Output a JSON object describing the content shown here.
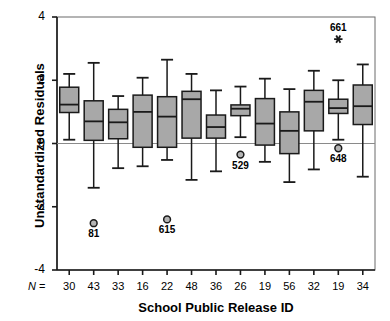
{
  "chart_data": {
    "type": "box",
    "title": "",
    "xlabel": "School Public Release ID",
    "ylabel": "Unstandardized Residuals",
    "ylim": [
      -4,
      4
    ],
    "yticks": [
      4,
      2,
      0,
      -2,
      -4
    ],
    "ytick_labels": [
      "4",
      "2",
      "0",
      "-2",
      "-4"
    ],
    "grid": false,
    "legend": null,
    "reference_line": 0,
    "n_prefix": "N =",
    "categories": [
      "30",
      "43",
      "33",
      "16",
      "22",
      "48",
      "36",
      "26",
      "19",
      "56",
      "32",
      "19",
      "34"
    ],
    "category_axis_name": "N",
    "boxes": [
      {
        "n": "30",
        "whisker_low": 0.12,
        "q1": 0.98,
        "median": 1.23,
        "q3": 1.78,
        "whisker_high": 2.2
      },
      {
        "n": "43",
        "whisker_low": -1.4,
        "q1": 0.1,
        "median": 0.7,
        "q3": 1.35,
        "whisker_high": 2.55
      },
      {
        "n": "33",
        "whisker_low": -0.78,
        "q1": 0.15,
        "median": 0.67,
        "q3": 1.08,
        "whisker_high": 1.5
      },
      {
        "n": "16",
        "whisker_low": -0.72,
        "q1": -0.12,
        "median": 1.0,
        "q3": 1.53,
        "whisker_high": 2.08
      },
      {
        "n": "22",
        "whisker_low": -0.52,
        "q1": -0.12,
        "median": 0.85,
        "q3": 1.48,
        "whisker_high": 2.65
      },
      {
        "n": "48",
        "whisker_low": -1.15,
        "q1": 0.17,
        "median": 1.4,
        "q3": 1.65,
        "whisker_high": 2.2
      },
      {
        "n": "36",
        "whisker_low": -0.88,
        "q1": 0.17,
        "median": 0.52,
        "q3": 0.9,
        "whisker_high": 1.68
      },
      {
        "n": "26",
        "whisker_low": 0.2,
        "q1": 0.88,
        "median": 1.1,
        "q3": 1.22,
        "whisker_high": 1.8
      },
      {
        "n": "19",
        "whisker_low": -0.58,
        "q1": -0.05,
        "median": 0.63,
        "q3": 1.42,
        "whisker_high": 2.05
      },
      {
        "n": "56",
        "whisker_low": -1.22,
        "q1": -0.32,
        "median": 0.4,
        "q3": 1.0,
        "whisker_high": 1.72
      },
      {
        "n": "32",
        "whisker_low": -0.82,
        "q1": 0.4,
        "median": 1.32,
        "q3": 1.68,
        "whisker_high": 2.3
      },
      {
        "n": "19",
        "whisker_low": 0.12,
        "q1": 0.95,
        "median": 1.12,
        "q3": 1.4,
        "whisker_high": 2.0
      },
      {
        "n": "34",
        "whisker_low": -1.05,
        "q1": 0.6,
        "median": 1.18,
        "q3": 1.85,
        "whisker_high": 2.5
      }
    ],
    "outliers": [
      {
        "box_index": 1,
        "value": -2.52,
        "label": "81",
        "marker": "circle",
        "label_position": "below"
      },
      {
        "box_index": 4,
        "value": -2.4,
        "label": "615",
        "marker": "circle",
        "label_position": "below"
      },
      {
        "box_index": 7,
        "value": -0.35,
        "label": "529",
        "marker": "circle",
        "label_position": "below"
      },
      {
        "box_index": 11,
        "value": -0.15,
        "label": "648",
        "marker": "circle",
        "label_position": "below"
      },
      {
        "box_index": 11,
        "value": 3.3,
        "label": "661",
        "marker": "asterisk",
        "label_position": "above"
      }
    ],
    "colors": {
      "box_fill": "#a8a8a8",
      "box_edge": "#1a1a1a",
      "whisker": "#1a1a1a",
      "median": "#1a1a1a",
      "axis": "#1a1a1a",
      "reference_line": "#8a8a8a",
      "text": "#000000"
    }
  }
}
